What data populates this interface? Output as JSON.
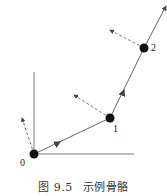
{
  "figure": {
    "number": "图 9.5",
    "title": "示例骨骼"
  },
  "joints": [
    {
      "label": "0",
      "x": 34,
      "y": 154
    },
    {
      "label": "1",
      "x": 110,
      "y": 118
    },
    {
      "label": "2",
      "x": 144,
      "y": 48
    }
  ],
  "colors": {
    "line": "#444444",
    "joint": "#111111"
  }
}
